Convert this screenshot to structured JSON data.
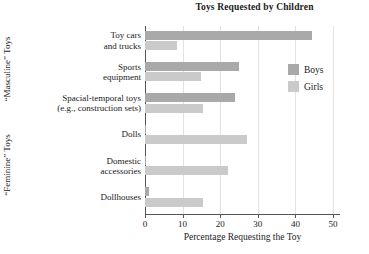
{
  "chart_data": {
    "type": "bar",
    "orientation": "horizontal",
    "title": "Toys Requested by Children",
    "xlabel": "Percentage Requesting the Toy",
    "ylabel": "",
    "xlim": [
      0,
      50
    ],
    "xticks": [
      0,
      10,
      20,
      30,
      40,
      50
    ],
    "grid": true,
    "legend_position": "right",
    "categories": [
      "Toy cars and trucks",
      "Sports equipment",
      "Spacial-temporal toys (e.g., construction sets)",
      "Dolls",
      "Domestic accessories",
      "Dollhouses"
    ],
    "series": [
      {
        "name": "Boys",
        "color": "#a9a9a9",
        "values": [
          44.5,
          25,
          24,
          0.3,
          0.3,
          1
        ]
      },
      {
        "name": "Girls",
        "color": "#cacaca",
        "values": [
          8.5,
          15,
          15.5,
          27,
          22,
          15.5
        ]
      }
    ],
    "group_labels": [
      {
        "text": "“Masculine” Toys",
        "categories": [
          "Toy cars and trucks",
          "Sports equipment",
          "Spacial-temporal toys (e.g., construction sets)"
        ]
      },
      {
        "text": "“Feminine” Toys",
        "categories": [
          "Dolls",
          "Domestic accessories",
          "Dollhouses"
        ]
      }
    ]
  },
  "title": "Toys Requested by Children",
  "axes": {
    "x_title": "Percentage Requesting the Toy",
    "tick_0": "0",
    "tick_1": "10",
    "tick_2": "20",
    "tick_3": "30",
    "tick_4": "40",
    "tick_5": "50"
  },
  "group_labels": {
    "masculine": "“Masculine” Toys",
    "feminine": "“Feminine” Toys"
  },
  "categories": [
    {
      "line1": "Toy cars",
      "line2": "and trucks"
    },
    {
      "line1": "Sports",
      "line2": "equipment"
    },
    {
      "line1": "Spacial-temporal toys",
      "line2": "(e.g., construction sets)"
    },
    {
      "line1": "Dolls",
      "line2": ""
    },
    {
      "line1": "Domestic",
      "line2": "accessories"
    },
    {
      "line1": "Dollhouses",
      "line2": ""
    }
  ],
  "legend": {
    "items": [
      {
        "label": "Boys",
        "color": "#a9a9a9"
      },
      {
        "label": "Girls",
        "color": "#cacaca"
      }
    ]
  }
}
